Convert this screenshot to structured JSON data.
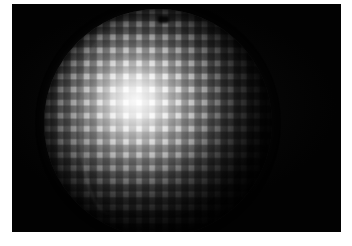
{
  "image": {
    "subject": "illuminated sphere with grid of rounded square tiles",
    "medium": "photograph",
    "plate": {
      "background_color": "#020202",
      "x": 12,
      "y": 4,
      "width": 329,
      "height": 228
    },
    "page": {
      "background_color": "#ffffff",
      "width": 352,
      "height": 246
    },
    "sphere": {
      "center_x": 158,
      "center_y": 123,
      "radius": 114,
      "highlight_color": "#ffffff",
      "highlight_x_pct": 40,
      "highlight_y_pct": 40,
      "shell_color": "#4a4a4a",
      "tile_shape": "rounded-square",
      "tile_grid_pitch_px": 13,
      "tile_size_px": 8,
      "tile_color": "#6e6e6e",
      "shadow_color": "#000000"
    },
    "features": {
      "pole_notch_label": "dark notch near top pole",
      "seam_label": "bright curved seam on lit face"
    }
  }
}
